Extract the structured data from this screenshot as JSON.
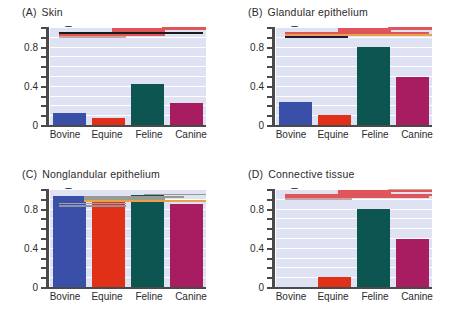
{
  "figure": {
    "background": "#ffffff",
    "plot_background": "#dfe2f2",
    "gridline_color": "#ffffff",
    "axis_color": "#4a4a4a"
  },
  "series_colors": {
    "bovine": "#3a4fa8",
    "equine": "#e03018",
    "feline": "#0d5550",
    "canine": "#a81d62"
  },
  "axis": {
    "ylabel": "Malignant tumors (%)",
    "yticks": [
      "0",
      "0.4",
      "0.8"
    ],
    "ytick_values": [
      0,
      0.4,
      0.8
    ],
    "ylim": [
      0,
      1.0
    ],
    "categories": [
      "Bovine",
      "Equine",
      "Feline",
      "Canine"
    ]
  },
  "panels": [
    {
      "tag": "(A)",
      "title": "Skin"
    },
    {
      "tag": "(B)",
      "title": "Glandular epithelium"
    },
    {
      "tag": "(C)",
      "title": "Nonglandular epithelium"
    },
    {
      "tag": "(D)",
      "title": "Connective tissue"
    }
  ],
  "chart_data": [
    {
      "type": "bar",
      "panel": "A",
      "title": "Skin",
      "xlabel": "",
      "ylabel": "Malignant tumors (%)",
      "ylim": [
        0,
        1.0
      ],
      "yticks": [
        0,
        0.4,
        0.8
      ],
      "grid": true,
      "categories": [
        "Bovine",
        "Equine",
        "Feline",
        "Canine"
      ],
      "values": [
        0.12,
        0.07,
        0.42,
        0.22
      ],
      "annotation_lines": [
        {
          "y": 0.905,
          "x_start": 0.055,
          "x_end": 0.49,
          "color": "#c9a2a2"
        },
        {
          "y": 0.925,
          "x_start": 0.055,
          "x_end": 0.74,
          "color": "#e0555a"
        },
        {
          "y": 0.945,
          "x_start": 0.055,
          "x_end": 0.98,
          "color": "#1a1a1a"
        },
        {
          "y": 0.965,
          "x_start": 0.4,
          "x_end": 0.74,
          "color": "#e0555a"
        },
        {
          "y": 0.985,
          "x_start": 0.4,
          "x_end": 1.0,
          "color": "#e0555a"
        },
        {
          "y": 1.005,
          "x_start": 0.72,
          "x_end": 1.0,
          "color": "#e0555a"
        }
      ]
    },
    {
      "type": "bar",
      "panel": "B",
      "title": "Glandular epithelium",
      "xlabel": "",
      "ylabel": "Malignant tumors (%)",
      "ylim": [
        0,
        1.0
      ],
      "yticks": [
        0,
        0.4,
        0.8
      ],
      "grid": true,
      "categories": [
        "Bovine",
        "Equine",
        "Feline",
        "Canine"
      ],
      "values": [
        0.23,
        0.1,
        0.8,
        0.49
      ],
      "annotation_lines": [
        {
          "y": 0.905,
          "x_start": 0.055,
          "x_end": 0.46,
          "color": "#1c1c38"
        },
        {
          "y": 0.925,
          "x_start": 0.055,
          "x_end": 1.0,
          "color": "#e8a34a"
        },
        {
          "y": 0.945,
          "x_start": 0.055,
          "x_end": 0.98,
          "color": "#e0555a"
        },
        {
          "y": 0.965,
          "x_start": 0.4,
          "x_end": 0.74,
          "color": "#e0555a"
        },
        {
          "y": 0.985,
          "x_start": 0.4,
          "x_end": 1.0,
          "color": "#e0555a"
        },
        {
          "y": 1.005,
          "x_start": 0.72,
          "x_end": 1.0,
          "color": "#e0555a"
        }
      ]
    },
    {
      "type": "bar",
      "panel": "C",
      "title": "Nonglandular epithelium",
      "xlabel": "",
      "ylabel": "Malignant tumors (%)",
      "ylim": [
        0,
        1.0
      ],
      "yticks": [
        0,
        0.4,
        0.8
      ],
      "grid": true,
      "categories": [
        "Bovine",
        "Equine",
        "Feline",
        "Canine"
      ],
      "values": [
        0.93,
        0.9,
        0.94,
        0.85
      ],
      "annotation_lines": [
        {
          "y": 0.84,
          "x_start": 0.055,
          "x_end": 0.49,
          "color": "#8e92a8"
        },
        {
          "y": 0.862,
          "x_start": 0.055,
          "x_end": 0.49,
          "color": "#a8a0a0"
        },
        {
          "y": 0.884,
          "x_start": 0.22,
          "x_end": 1.0,
          "color": "#e8a34a"
        },
        {
          "y": 0.906,
          "x_start": 0.22,
          "x_end": 0.74,
          "color": "#9a9a92"
        },
        {
          "y": 0.928,
          "x_start": 0.22,
          "x_end": 0.86,
          "color": "#9a9a92"
        },
        {
          "y": 0.95,
          "x_start": 0.6,
          "x_end": 1.0,
          "color": "#9a9a92"
        }
      ]
    },
    {
      "type": "bar",
      "panel": "D",
      "title": "Connective tissue",
      "xlabel": "",
      "ylabel": "Malignant tumors (%)",
      "ylim": [
        0,
        1.0
      ],
      "yticks": [
        0,
        0.4,
        0.8
      ],
      "grid": true,
      "categories": [
        "Bovine",
        "Equine",
        "Feline",
        "Canine"
      ],
      "values": [
        0.0,
        0.1,
        0.8,
        0.49
      ],
      "annotation_lines": [
        {
          "y": 0.905,
          "x_start": 0.055,
          "x_end": 0.49,
          "color": "#c9a2a2"
        },
        {
          "y": 0.925,
          "x_start": 0.055,
          "x_end": 0.98,
          "color": "#e0555a"
        },
        {
          "y": 0.945,
          "x_start": 0.055,
          "x_end": 1.0,
          "color": "#e0555a"
        },
        {
          "y": 0.965,
          "x_start": 0.4,
          "x_end": 0.74,
          "color": "#e0555a"
        },
        {
          "y": 0.985,
          "x_start": 0.4,
          "x_end": 1.0,
          "color": "#e0555a"
        },
        {
          "y": 1.005,
          "x_start": 0.72,
          "x_end": 1.0,
          "color": "#c9a98a"
        }
      ]
    }
  ]
}
